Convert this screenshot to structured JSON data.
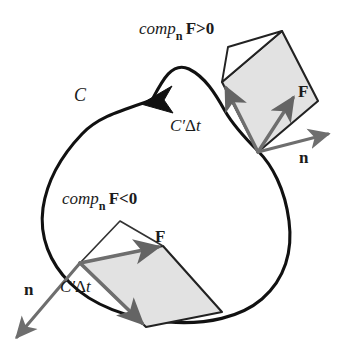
{
  "figure": {
    "background_color": "#ffffff",
    "width": 345,
    "height": 356
  },
  "colors": {
    "curve_stroke": "#111111",
    "arrow_gray": "#6e6e6e",
    "arrow_gray_dark": "#555555",
    "parallelogram_fill": "#e2e2e2",
    "parallelogram_stroke": "#222222",
    "thin_stroke": "#333333",
    "text": "#1b1b1b"
  },
  "labels": {
    "curve": {
      "id": "curve-label-c",
      "text": "C",
      "style": "italic"
    },
    "comp_positive": {
      "id": "comp-positive-label",
      "prefix": "comp",
      "subscript": "n",
      "field": "F",
      "relation": ">0",
      "full_text": "compₙ F>0"
    },
    "comp_negative": {
      "id": "comp-negative-label",
      "prefix": "comp",
      "subscript": "n",
      "field": "F",
      "relation": "<0",
      "full_text": "compₙ F<0"
    },
    "displacement_top": {
      "id": "c-prime-delta-t-top",
      "symbol": "C",
      "prime": "′",
      "delta": "Δ",
      "variable": "t",
      "full_text": "C′Δt"
    },
    "displacement_bottom": {
      "id": "c-prime-delta-t-bottom",
      "symbol": "C",
      "prime": "′",
      "delta": "Δ",
      "variable": "t",
      "full_text": "C′Δt"
    },
    "force_top": {
      "id": "force-vector-label-top",
      "text": "F"
    },
    "force_bottom": {
      "id": "force-vector-label-bottom",
      "text": "F"
    },
    "normal_right": {
      "id": "normal-vector-label-right",
      "text": "n"
    },
    "normal_left": {
      "id": "normal-vector-label-left",
      "text": "n"
    }
  },
  "geometry": {
    "closed_curve_path": "M 152 100 C 118 112 96 118 80 136 C 60 158 48 182 44 208 C 40 236 50 262 70 282 C 92 304 128 318 168 322 C 208 326 242 318 262 300 C 284 280 292 252 288 222 C 284 190 272 166 258 152 C 244 138 232 126 224 112 C 214 94 204 78 188 70 C 172 62 162 82 152 100 Z",
    "direction_arrow": {
      "name": "curve-direction-arrowhead",
      "points": "152,99 173,88 165,101 172,112"
    },
    "upper": {
      "base_point": [
        258,
        152
      ],
      "force_tip": [
        296,
        95
      ],
      "displacement_tip": [
        222,
        82
      ],
      "normal_tip": [
        330,
        134
      ],
      "shaded_parallelogram": "258,152 222,82 282,31 318,101",
      "thin_parallelogram": "228,48 282,31 222,82",
      "thin_edges": "M 228 48 L 282 31 M 228 48 L 222 82"
    },
    "lower": {
      "base_point": [
        80,
        263
      ],
      "force_tip": [
        162,
        247
      ],
      "displacement_tip": [
        146,
        326
      ],
      "normal_tip": [
        14,
        340
      ],
      "shaded_parallelogram": "80,263 162,247 222,312 146,326",
      "thin_edges": "M 80 263 L 120 222 L 162 247",
      "thin_right_edge": "M 162 247 L 222 312"
    }
  },
  "annotations": {
    "description": "A closed oriented curve C with two sample points. At each point the outward normal n, the force vector F, and the tangential displacement C'Δt are drawn, spanning a shaded parallelogram. At the upper point comp_n F>0; at the lower point comp_n F<0."
  }
}
